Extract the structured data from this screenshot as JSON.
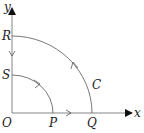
{
  "diagram": {
    "axes": {
      "x_label": "x",
      "y_label": "y",
      "origin_label": "O"
    },
    "points": {
      "P": "P",
      "Q": "Q",
      "R": "R",
      "S": "S"
    },
    "curve_label": "C",
    "colors": {
      "stroke": "#555555",
      "text": "#222222",
      "background": "#ffffff"
    }
  }
}
